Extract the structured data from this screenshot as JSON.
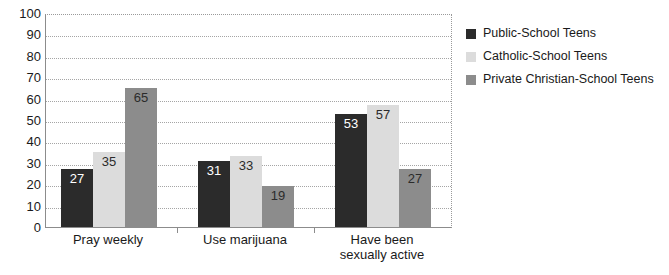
{
  "chart_data": {
    "type": "bar",
    "title": "",
    "subtitle": "",
    "xlabel": "",
    "ylabel": "",
    "ylim": [
      0,
      100
    ],
    "y_ticks": [
      0,
      10,
      20,
      30,
      40,
      50,
      60,
      70,
      80,
      90,
      100
    ],
    "grid": true,
    "grid_axis": "y",
    "legend_position": "right",
    "categories": [
      "Pray weekly",
      "Use marijuana",
      "Have been sexually active"
    ],
    "category_lines": [
      [
        "Pray weekly"
      ],
      [
        "Use marijuana"
      ],
      [
        "Have been",
        "sexually active"
      ]
    ],
    "series": [
      {
        "name": "Public-School Teens",
        "color": "#2b2b2b",
        "values": [
          27,
          31,
          53
        ]
      },
      {
        "name": "Catholic-School Teens",
        "color": "#dcdcdc",
        "values": [
          35,
          33,
          57
        ]
      },
      {
        "name": "Private Christian-School Teens",
        "color": "#8c8c8c",
        "values": [
          65,
          19,
          27
        ]
      }
    ],
    "data_labels": [
      [
        27,
        35,
        65
      ],
      [
        31,
        33,
        19
      ],
      [
        53,
        57,
        27
      ]
    ]
  },
  "legend": {
    "items": [
      {
        "label": "Public-School Teens",
        "color": "#2b2b2b"
      },
      {
        "label": "Catholic-School Teens",
        "color": "#dcdcdc"
      },
      {
        "label": "Private Christian-School Teens",
        "color": "#8c8c8c"
      }
    ]
  },
  "axis": {
    "y_tick_labels": [
      "100",
      "90",
      "80",
      "70",
      "60",
      "50",
      "40",
      "30",
      "20",
      "10",
      "0"
    ]
  }
}
